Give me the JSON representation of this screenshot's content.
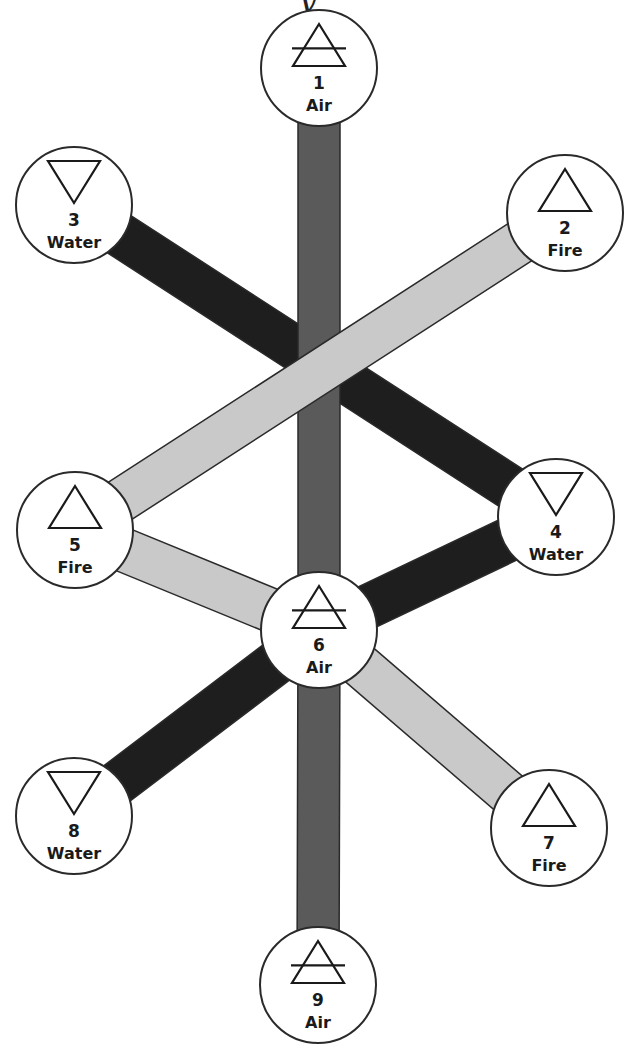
{
  "title_fragment": "y",
  "colors": {
    "air_band": "#5a5a5a",
    "water_band": "#1e1e1e",
    "fire_band": "#c9c9c9",
    "outline": "#2a2a2a",
    "node_fill": "#ffffff"
  },
  "nodes": [
    {
      "id": 1,
      "number": "1",
      "element": "Air",
      "symbol": "air-triangle",
      "cx": 319,
      "cy": 68
    },
    {
      "id": 2,
      "number": "2",
      "element": "Fire",
      "symbol": "fire-triangle",
      "cx": 565,
      "cy": 213
    },
    {
      "id": 3,
      "number": "3",
      "element": "Water",
      "symbol": "water-triangle",
      "cx": 74,
      "cy": 205
    },
    {
      "id": 4,
      "number": "4",
      "element": "Water",
      "symbol": "water-triangle",
      "cx": 556,
      "cy": 517
    },
    {
      "id": 5,
      "number": "5",
      "element": "Fire",
      "symbol": "fire-triangle",
      "cx": 75,
      "cy": 530
    },
    {
      "id": 6,
      "number": "6",
      "element": "Air",
      "symbol": "air-triangle",
      "cx": 319,
      "cy": 630
    },
    {
      "id": 7,
      "number": "7",
      "element": "Fire",
      "symbol": "fire-triangle",
      "cx": 549,
      "cy": 828
    },
    {
      "id": 8,
      "number": "8",
      "element": "Water",
      "symbol": "water-triangle",
      "cx": 74,
      "cy": 816
    },
    {
      "id": 9,
      "number": "9",
      "element": "Air",
      "symbol": "air-triangle",
      "cx": 318,
      "cy": 985
    }
  ],
  "connections": [
    {
      "from": 1,
      "to": 6,
      "type": "Air"
    },
    {
      "from": 6,
      "to": 9,
      "type": "Air"
    },
    {
      "from": 3,
      "to": 4,
      "type": "Water"
    },
    {
      "from": 2,
      "to": 5,
      "type": "Fire"
    },
    {
      "from": 5,
      "to": 6,
      "type": "Fire"
    },
    {
      "from": 6,
      "to": 7,
      "type": "Fire"
    },
    {
      "from": 4,
      "to": 6,
      "type": "Water"
    },
    {
      "from": 6,
      "to": 8,
      "type": "Water"
    }
  ]
}
